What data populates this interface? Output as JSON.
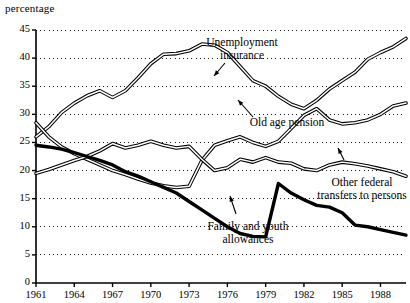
{
  "chart_data": {
    "type": "line",
    "title": "",
    "xlabel": "",
    "ylabel": "percentage",
    "xlim": [
      1961,
      1990
    ],
    "ylim": [
      0,
      45
    ],
    "grid": true,
    "legend_position": "inline-annotations",
    "yticks": [
      0,
      5,
      10,
      15,
      20,
      25,
      30,
      35,
      40,
      45
    ],
    "xticks": [
      1961,
      1964,
      1967,
      1970,
      1973,
      1976,
      1979,
      1982,
      1985,
      1988
    ],
    "x": [
      1961,
      1962,
      1963,
      1964,
      1965,
      1966,
      1967,
      1968,
      1969,
      1970,
      1971,
      1972,
      1973,
      1974,
      1975,
      1976,
      1977,
      1978,
      1979,
      1980,
      1981,
      1982,
      1983,
      1984,
      1985,
      1986,
      1987,
      1988,
      1989,
      1990
    ],
    "series": [
      {
        "name": "Unemployment insurance",
        "style": "outline",
        "values": [
          26.0,
          27.8,
          30.3,
          32.0,
          33.3,
          34.2,
          33.0,
          34.2,
          36.5,
          39.0,
          40.7,
          40.8,
          41.3,
          42.5,
          42.3,
          41.0,
          38.5,
          36.0,
          35.0,
          33.2,
          31.8,
          31.0,
          32.5,
          34.5,
          36.0,
          37.5,
          39.8,
          41.0,
          42.0,
          43.5
        ]
      },
      {
        "name": "Old age pension",
        "style": "outline",
        "values": [
          28.5,
          26.0,
          24.2,
          23.0,
          22.0,
          21.0,
          20.0,
          19.3,
          18.5,
          17.8,
          17.3,
          17.0,
          17.2,
          21.8,
          24.5,
          25.3,
          26.0,
          25.0,
          24.3,
          25.2,
          27.5,
          29.8,
          31.0,
          29.0,
          28.3,
          28.5,
          29.0,
          30.0,
          31.5,
          32.0
        ]
      },
      {
        "name": "Other federal transfers to persons",
        "style": "outline",
        "values": [
          19.5,
          20.2,
          21.0,
          21.8,
          22.5,
          23.5,
          24.8,
          24.0,
          24.5,
          25.2,
          24.5,
          24.0,
          24.3,
          22.0,
          20.0,
          20.5,
          22.0,
          21.5,
          22.3,
          21.5,
          21.3,
          20.3,
          20.0,
          21.0,
          21.5,
          21.2,
          20.8,
          20.3,
          19.8,
          19.0
        ]
      },
      {
        "name": "Family and youth allowances",
        "style": "bold",
        "values": [
          24.5,
          24.2,
          23.8,
          23.2,
          22.5,
          21.8,
          21.0,
          19.8,
          19.0,
          18.0,
          17.0,
          16.0,
          14.5,
          13.0,
          11.5,
          10.0,
          8.8,
          8.3,
          8.2,
          17.7,
          16.0,
          14.8,
          13.8,
          13.5,
          12.5,
          10.3,
          10.0,
          9.5,
          9.0,
          8.5
        ]
      }
    ],
    "annotations": [
      {
        "label": "Unemployment\ninsurance",
        "line1": "Unemployment",
        "line2": "insurance"
      },
      {
        "label": "Old age pension",
        "line1": "Old age pension",
        "line2": ""
      },
      {
        "label": "Other federal\ntransfers to persons",
        "line1": "Other federal",
        "line2": "transfers to persons"
      },
      {
        "label": "Family and youth\nallowances",
        "line1": "Family and youth",
        "line2": "allowances"
      }
    ],
    "colors": {
      "line": "#000000",
      "grid": "#000000",
      "axis": "#000000",
      "background": "#ffffff"
    }
  }
}
